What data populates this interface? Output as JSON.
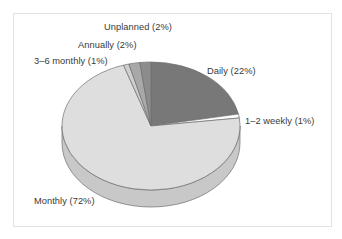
{
  "figure": {
    "border_color": "#e2e2e2",
    "background": "#ffffff"
  },
  "chart_data": {
    "type": "pie",
    "title": "",
    "subtitle": "",
    "xlabel": "",
    "ylabel": "",
    "three_d": true,
    "grid": false,
    "legend_position": "none",
    "labels_position": "outside-callout",
    "start_angle_deg": 0,
    "direction": "clockwise",
    "categories": [
      "Daily",
      "1–2 weekly",
      "Monthly",
      "3–6 monthly",
      "Annually",
      "Unplanned"
    ],
    "values": [
      22,
      1,
      72,
      1,
      2,
      2
    ],
    "units": "percent",
    "total": 100,
    "slices": [
      {
        "name": "Daily",
        "value": 22,
        "label": "Daily (22%)",
        "color": "#787878"
      },
      {
        "name": "1–2 weekly",
        "value": 1,
        "label": "1–2 weekly (1%)",
        "color": "#fbfbfb"
      },
      {
        "name": "Monthly",
        "value": 72,
        "label": "Monthly (72%)",
        "color": "#dedede"
      },
      {
        "name": "3–6 monthly",
        "value": 1,
        "label": "3–6 monthly (1%)",
        "color": "#cfcfcf"
      },
      {
        "name": "Annually",
        "value": 2,
        "label": "Annually (2%)",
        "color": "#a8a8a8"
      },
      {
        "name": "Unplanned",
        "value": 2,
        "label": "Unplanned (2%)",
        "color": "#8c8c8c"
      }
    ],
    "annotations": []
  },
  "labels": {
    "unplanned": "Unplanned (2%)",
    "annually": "Annually (2%)",
    "three_six_monthly": "3–6 monthly (1%)",
    "daily": "Daily (22%)",
    "one_two_weekly": "1–2 weekly (1%)",
    "monthly": "Monthly (72%)"
  }
}
